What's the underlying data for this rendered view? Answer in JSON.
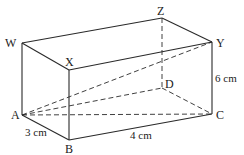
{
  "diagram": {
    "type": "cuboid",
    "stroke_color": "#2a2a2a",
    "vertices": {
      "W": {
        "label": "W",
        "x": 22,
        "y": 43
      },
      "X": {
        "label": "X",
        "x": 69,
        "y": 70
      },
      "Y": {
        "label": "Y",
        "x": 212,
        "y": 42
      },
      "Z": {
        "label": "Z",
        "x": 162,
        "y": 18
      },
      "A": {
        "label": "A",
        "x": 22,
        "y": 115
      },
      "B": {
        "label": "B",
        "x": 69,
        "y": 140
      },
      "C": {
        "label": "C",
        "x": 212,
        "y": 114
      },
      "D": {
        "label": "D",
        "x": 162,
        "y": 88
      }
    },
    "dimensions": {
      "AB": "3 cm",
      "BC": "4 cm",
      "CY": "6 cm"
    },
    "solid_edges": [
      "WZ",
      "ZY",
      "WX",
      "XY",
      "WA",
      "XB",
      "YC",
      "AB",
      "BC"
    ],
    "dashed_edges": [
      "ZD",
      "AD",
      "DC",
      "AC",
      "AY"
    ]
  }
}
